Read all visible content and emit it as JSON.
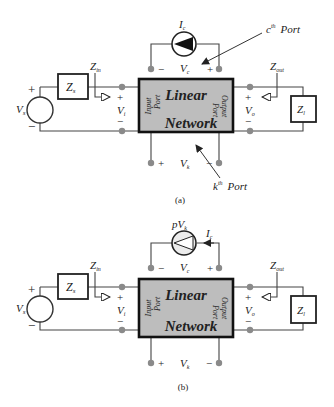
{
  "diagrams": [
    {
      "id": "a",
      "caption": "(a)",
      "network": {
        "line1": "Linear",
        "line2": "Network"
      },
      "input_port_label": {
        "line1": "Input",
        "line2": "Port"
      },
      "output_port_label": {
        "line1": "Output",
        "line2": "Port"
      },
      "source": {
        "label": "V",
        "sub": "s",
        "plus": "+",
        "minus": "−"
      },
      "source_impedance": {
        "label": "Z",
        "sub": "s"
      },
      "load_impedance": {
        "label": "Z",
        "sub": "l"
      },
      "z_in": {
        "label": "Z",
        "sub": "in"
      },
      "z_out": {
        "label": "Z",
        "sub": "out"
      },
      "v_input": {
        "label": "V",
        "sub": "i",
        "plus": "+",
        "minus": "−"
      },
      "v_output": {
        "label": "V",
        "sub": "o",
        "plus": "+",
        "minus": "−"
      },
      "v_control": {
        "label": "V",
        "sub": "c",
        "plus": "+",
        "minus": "−"
      },
      "v_k": {
        "label": "V",
        "sub": "k",
        "plus": "+",
        "minus": "−"
      },
      "top_source": {
        "label": "I",
        "sub": "c",
        "type": "current-source-filled"
      },
      "c_port_annotation": {
        "sup_base": "c",
        "sup": "th",
        "text": "Port"
      },
      "k_port_annotation": {
        "sup_base": "k",
        "sup": "th",
        "text": "Port"
      }
    },
    {
      "id": "b",
      "caption": "(b)",
      "network": {
        "line1": "Linear",
        "line2": "Network"
      },
      "input_port_label": {
        "line1": "Input",
        "line2": "Port"
      },
      "output_port_label": {
        "line1": "Output",
        "line2": "Port"
      },
      "source": {
        "label": "V",
        "sub": "s",
        "plus": "+",
        "minus": "−"
      },
      "source_impedance": {
        "label": "Z",
        "sub": "s"
      },
      "load_impedance": {
        "label": "Z",
        "sub": "l"
      },
      "z_in": {
        "label": "Z",
        "sub": "in"
      },
      "z_out": {
        "label": "Z",
        "sub": "out"
      },
      "v_input": {
        "label": "V",
        "sub": "i",
        "plus": "+",
        "minus": "−"
      },
      "v_output": {
        "label": "V",
        "sub": "o",
        "plus": "+",
        "minus": "−"
      },
      "v_control": {
        "label": "V",
        "sub": "c",
        "plus": "+",
        "minus": "−"
      },
      "v_k": {
        "label": "V",
        "sub": "k",
        "plus": "+",
        "minus": "−"
      },
      "top_source": {
        "label": "pV",
        "sub": "k",
        "type": "dependent-current-source-outline"
      },
      "current_label": {
        "label": "I",
        "sub": "c"
      }
    }
  ],
  "colors": {
    "network_fill": "#bdbdbd",
    "node": "#8a8a8a",
    "line": "#444444"
  }
}
